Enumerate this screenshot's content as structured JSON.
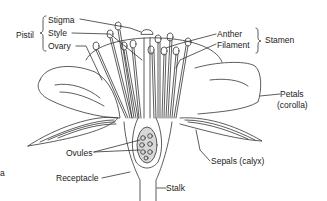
{
  "diagram": {
    "groups": {
      "pistil": "Pistil",
      "stamen": "Stamen"
    },
    "labels": {
      "stigma": "Stigma",
      "style": "Style",
      "ovary": "Ovary",
      "anther": "Anther",
      "filament": "Filament",
      "petals": "Petals",
      "corolla": "(corolla)",
      "sepals": "Sepals (calyx)",
      "ovules": "Ovules",
      "receptacle": "Receptacle",
      "stalk": "Stalk",
      "edge_fragment": "a"
    },
    "colors": {
      "line": "#333333",
      "background": "#ffffff",
      "ovary_fill": "#d8d8d8"
    }
  }
}
